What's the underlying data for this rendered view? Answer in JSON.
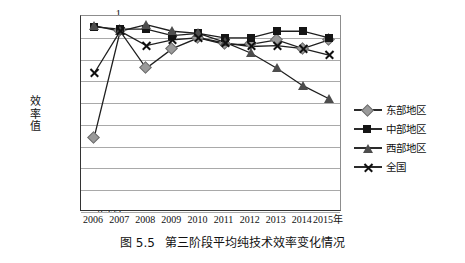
{
  "caption": {
    "number": "图 5.5",
    "text": "第三阶段平均纯技术效率变化情况"
  },
  "axis": {
    "ylabel": "效率值",
    "xlabel_suffix": "年"
  },
  "chart_data": {
    "type": "line",
    "title": "第三阶段平均纯技术效率变化情况",
    "xlabel": "",
    "ylabel": "效率值",
    "categories": [
      "2006",
      "2007",
      "2008",
      "2009",
      "2010",
      "2011",
      "2012",
      "2013",
      "2014",
      "2015"
    ],
    "xtick_labels": [
      "2006",
      "2007",
      "2008",
      "2009",
      "2010",
      "2011",
      "2012",
      "2013",
      "2014",
      "2015年"
    ],
    "ylim": [
      0.955,
      1.0
    ],
    "ytick_labels": [
      "1",
      "0.995",
      "0.99",
      "0.985",
      "0.98",
      "0.975",
      "0.97",
      "0.965",
      "0.96",
      "0.955"
    ],
    "ytick_values": [
      1,
      0.995,
      0.99,
      0.985,
      0.98,
      0.975,
      0.97,
      0.965,
      0.96,
      0.955
    ],
    "grid": true,
    "legend_position": "right",
    "series": [
      {
        "name": "东部地区",
        "marker": "diamond",
        "color": "#9a9a9a",
        "values": [
          0.972,
          0.9965,
          0.988,
          0.9925,
          0.995,
          0.9935,
          0.9935,
          0.9945,
          0.9925,
          0.9945
        ]
      },
      {
        "name": "中部地区",
        "marker": "square",
        "color": "#151515",
        "values": [
          0.9975,
          0.997,
          0.997,
          0.9955,
          0.996,
          0.995,
          0.995,
          0.9965,
          0.9965,
          0.995
        ]
      },
      {
        "name": "西部地区",
        "marker": "triangle",
        "color": "#4d4d4d",
        "values": [
          0.9978,
          0.9965,
          0.998,
          0.9965,
          0.996,
          0.994,
          0.9915,
          0.988,
          0.984,
          0.981
        ]
      },
      {
        "name": "全国",
        "marker": "cross",
        "color": "#111111",
        "values": [
          0.9868,
          0.9965,
          0.9932,
          0.9945,
          0.995,
          0.9938,
          0.993,
          0.9932,
          0.9925,
          0.991
        ]
      }
    ]
  }
}
